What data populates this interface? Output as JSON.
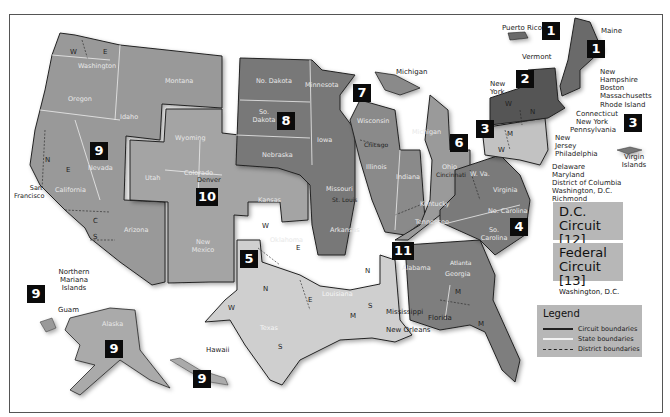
{
  "map": {
    "title_hint": "U.S. Federal Judicial Circuits",
    "colors": {
      "background": "#ffffff",
      "circuit_dark": "#6e6e6e",
      "circuit_mid": "#8e8e8e",
      "circuit_light": "#b9b9b9",
      "circuit_lighter": "#d2d2d2",
      "label_box": "#0b0b0b",
      "info_box": "#b7b7b7"
    },
    "circuits": [
      {
        "number": "1",
        "label": "1"
      },
      {
        "number": "2",
        "label": "2"
      },
      {
        "number": "3",
        "label": "3"
      },
      {
        "number": "4",
        "label": "4"
      },
      {
        "number": "5",
        "label": "5"
      },
      {
        "number": "6",
        "label": "6"
      },
      {
        "number": "7",
        "label": "7"
      },
      {
        "number": "8",
        "label": "8"
      },
      {
        "number": "9",
        "label": "9"
      },
      {
        "number": "10",
        "label": "10"
      },
      {
        "number": "11",
        "label": "11"
      }
    ],
    "states": {
      "washington": "Washington",
      "oregon": "Oregon",
      "idaho": "Idaho",
      "montana": "Montana",
      "nevada": "Nevada",
      "california": "California",
      "arizona": "Arizona",
      "wyoming": "Wyoming",
      "utah": "Utah",
      "colorado": "Colorado",
      "kansas": "Kansas",
      "new_mexico": "New Mexico",
      "oklahoma": "Oklahoma",
      "no_dakota": "No. Dakota",
      "so_dakota": "So. Dakota",
      "nebraska": "Nebraska",
      "minnesota": "Minnesota",
      "iowa": "Iowa",
      "missouri": "Missouri",
      "arkansas": "Arkansas",
      "wisconsin": "Wisconsin",
      "illinois": "Illinois",
      "indiana": "Indiana",
      "michigan_lp": "Michigan",
      "michigan": "Michigan",
      "ohio": "Ohio",
      "kentucky": "Kentucky",
      "tennessee": "Tennessee",
      "texas": "Texas",
      "louisiana": "Louisiana",
      "mississippi": "Mississippi",
      "alabama": "Alabama",
      "georgia": "Georgia",
      "florida": "Florida",
      "w_va": "W. Va.",
      "virginia": "Virginia",
      "no_carolina": "No. Carolina",
      "so_carolina": "So. Carolina",
      "new_york_state": "New York",
      "vermont": "Vermont",
      "maine": "Maine",
      "new_hampshire": "New Hampshire",
      "massachusetts": "Massachusetts",
      "rhode_island": "Rhode Island",
      "connecticut": "Connecticut",
      "pennsylvania": "Pennsylvania",
      "new_jersey": "New Jersey",
      "delaware": "Delaware",
      "maryland": "Maryland",
      "district_of_columbia": "District of Columbia",
      "alaska": "Alaska",
      "hawaii": "Hawaii",
      "puerto_rico": "Puerto Rico",
      "virgin_islands": "Virgin Islands",
      "guam": "Guam",
      "northern_mariana": "Northern Mariana Islands"
    },
    "cities": {
      "san_francisco": "San Francisco",
      "denver": "Denver",
      "st_louis": "St. Louis",
      "chicago": "Chicago",
      "cincinnati": "Cincinnati",
      "new_orleans": "New Orleans",
      "atlanta": "Atlanta",
      "richmond": "Richmond",
      "washington_dc": "Washington, D.C.",
      "philadelphia": "Philadelphia",
      "new_york_city": "New York",
      "boston": "Boston"
    },
    "district_letters": {
      "W": "W",
      "E": "E",
      "N": "N",
      "S": "S",
      "C": "C",
      "M": "M"
    }
  },
  "dc_circuit": {
    "title_line1": "D.C.",
    "title_line2": "Circuit [12]",
    "city": "Washington, D.C."
  },
  "federal_circuit": {
    "title_line1": "Federal",
    "title_line2": "Circuit [13]",
    "city": "Washington, D.C."
  },
  "legend": {
    "title": "Legend",
    "items": [
      {
        "label": "Circuit boundaries",
        "style": "solid-dark"
      },
      {
        "label": "State boundaries",
        "style": "solid-white"
      },
      {
        "label": "District boundaries",
        "style": "dashed"
      }
    ]
  }
}
